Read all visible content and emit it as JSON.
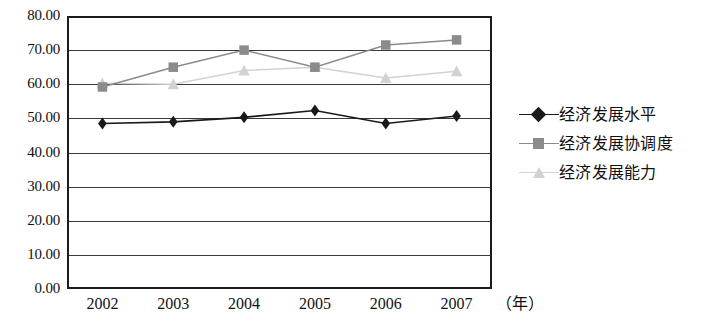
{
  "chart_data": {
    "type": "line",
    "title": "",
    "xlabel": "（年）",
    "ylabel": "",
    "x": [
      "2002",
      "2003",
      "2004",
      "2005",
      "2006",
      "2007"
    ],
    "categories": [
      "2002",
      "2003",
      "2004",
      "2005",
      "2006",
      "2007"
    ],
    "ylim": [
      0.0,
      80.0
    ],
    "ytick_step": 10.0,
    "ytick_labels": [
      "80.00",
      "70.00",
      "60.00",
      "50.00",
      "40.00",
      "30.00",
      "20.00",
      "10.00",
      "0.00"
    ],
    "ytick_values": [
      80.0,
      70.0,
      60.0,
      50.0,
      40.0,
      30.0,
      20.0,
      10.0,
      0.0
    ],
    "grid": true,
    "grid_axis": "y",
    "legend_position": "right",
    "series": [
      {
        "name": "经济发展水平",
        "marker": "diamond",
        "color": "#1a1a1a",
        "values": [
          48.5,
          49.0,
          50.3,
          52.3,
          48.5,
          50.7
        ]
      },
      {
        "name": "经济发展协调度",
        "marker": "square",
        "color": "#8b8b8b",
        "values": [
          59.2,
          65.0,
          70.0,
          65.0,
          71.5,
          73.0
        ]
      },
      {
        "name": "经济发展能力",
        "marker": "triangle",
        "color": "#d2d2d2",
        "values": [
          60.3,
          60.0,
          64.0,
          65.0,
          61.8,
          63.8
        ]
      }
    ]
  },
  "axis": {
    "y_labels": [
      "80.00",
      "70.00",
      "60.00",
      "50.00",
      "40.00",
      "30.00",
      "20.00",
      "10.00",
      "0.00"
    ],
    "x_labels": [
      "2002",
      "2003",
      "2004",
      "2005",
      "2006",
      "2007"
    ],
    "x_unit": "（年）"
  },
  "legend": {
    "items": [
      {
        "label": "经济发展水平",
        "marker": "diamond-marker",
        "color": "#1a1a1a"
      },
      {
        "label": "经济发展协调度",
        "marker": "square-marker",
        "color": "#8b8b8b"
      },
      {
        "label": "经济发展能力",
        "marker": "triangle-marker",
        "color": "#d2d2d2"
      }
    ]
  }
}
